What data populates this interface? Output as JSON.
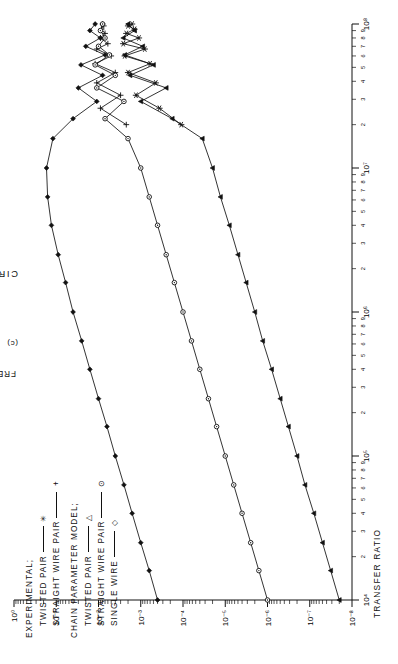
{
  "figure": {
    "caption_title": "CIRCUIT SEPARATION: 2 CM.",
    "subcaption": "(c)"
  },
  "legend": {
    "group1_heading": "EXPERIMENTAL;",
    "group2_heading": "CHAIN PARAMETER MODEL;",
    "entries": [
      {
        "label": "TWISTED PAIR",
        "marker": "asterisk-marker",
        "glyph": "✳",
        "group": 1
      },
      {
        "label": "STRAIGHT WIRE PAIR",
        "marker": "plus-marker",
        "glyph": "+",
        "group": 1
      },
      {
        "label": "TWISTED PAIR",
        "marker": "triangle-marker",
        "glyph": "△",
        "group": 2
      },
      {
        "label": "STRAIGHT WIRE PAIR",
        "marker": "circle-marker",
        "glyph": "⊙",
        "group": 2
      },
      {
        "label": "SINGLE WIRE",
        "marker": "diamond-marker",
        "glyph": "◇",
        "group": 2
      }
    ]
  },
  "chart_data": {
    "type": "line",
    "title": "CIRCUIT SEPARATION: 2 CM.",
    "xlabel": "FREQUENCY (HZ.)",
    "ylabel": "TRANSFER RATIO",
    "xscale": "log",
    "yscale": "log",
    "xlim": [
      10000,
      100000000
    ],
    "ylim": [
      1e-08,
      1
    ],
    "grid": false,
    "legend_position": "upper-left",
    "x_tick_labels": [
      "10⁴",
      "10⁵",
      "10⁶",
      "10⁷",
      "10⁸"
    ],
    "x_tick_values": [
      10000,
      100000,
      1000000,
      10000000,
      100000000
    ],
    "x_minor_labels": [
      "2",
      "3",
      "4",
      "5",
      "6",
      "7",
      "8",
      "9"
    ],
    "y_tick_labels": [
      "10⁰",
      "10⁻¹",
      "10⁻²",
      "10⁻³",
      "10⁻⁴",
      "10⁻⁵",
      "10⁻⁶",
      "10⁻⁷",
      "10⁻⁸"
    ],
    "y_tick_values": [
      1,
      0.1,
      0.01,
      0.001,
      0.0001,
      1e-05,
      1e-06,
      1e-07,
      1e-08
    ],
    "series": [
      {
        "name": "EXPERIMENTAL TWISTED PAIR",
        "marker": "asterisk-marker",
        "x": [
          20000000.0,
          26000000.0,
          32000000.0,
          39000000.0,
          46000000.0,
          53000000.0,
          60000000.0,
          67000000.0,
          73000000.0,
          80000000.0,
          86000000.0,
          92000000.0,
          97000000.0,
          100000000.0
        ],
        "y": [
          0.00011,
          0.00036,
          0.0013,
          0.00044,
          0.002,
          0.0006,
          0.0024,
          0.0008,
          0.0026,
          0.0011,
          0.0022,
          0.0014,
          0.002,
          0.0016
        ]
      },
      {
        "name": "EXPERIMENTAL STRAIGHT WIRE PAIR",
        "marker": "plus-marker",
        "x": [
          20000000.0,
          26000000.0,
          32000000.0,
          39000000.0,
          46000000.0,
          53000000.0,
          60000000.0,
          67000000.0,
          73000000.0,
          80000000.0,
          86000000.0,
          92000000.0,
          97000000.0,
          100000000.0
        ],
        "y": [
          0.0022,
          0.009,
          0.003,
          0.011,
          0.004,
          0.012,
          0.005,
          0.011,
          0.006,
          0.009,
          0.007,
          0.0085,
          0.0075,
          0.008
        ]
      },
      {
        "name": "MODEL TWISTED PAIR",
        "marker": "triangle-marker",
        "x": [
          10000.0,
          16000.0,
          25000.0,
          40000.0,
          63000.0,
          100000.0,
          160000.0,
          250000.0,
          400000.0,
          630000.0,
          1000000.0,
          1600000.0,
          2500000.0,
          4000000.0,
          6300000.0,
          10000000.0,
          16000000.0,
          22000000.0,
          29000000.0,
          36000000.0,
          44000000.0,
          52000000.0,
          61000000.0,
          70000000.0,
          80000000.0,
          90000000.0,
          100000000.0
        ],
        "y": [
          2e-08,
          3.2e-08,
          5e-08,
          8e-08,
          1.3e-07,
          2e-07,
          3.2e-07,
          5e-07,
          8e-07,
          1.3e-06,
          2e-06,
          3.2e-06,
          5e-06,
          8e-06,
          1.3e-05,
          2e-05,
          3.5e-05,
          0.00018,
          0.001,
          0.00025,
          0.0018,
          0.0005,
          0.0024,
          0.0009,
          0.0026,
          0.0014,
          0.002
        ]
      },
      {
        "name": "MODEL STRAIGHT WIRE PAIR",
        "marker": "circle-marker",
        "x": [
          10000.0,
          16000.0,
          25000.0,
          40000.0,
          63000.0,
          100000.0,
          160000.0,
          250000.0,
          400000.0,
          630000.0,
          1000000.0,
          1600000.0,
          2500000.0,
          4000000.0,
          6300000.0,
          10000000.0,
          16000000.0,
          22000000.0,
          29000000.0,
          36000000.0,
          44000000.0,
          52000000.0,
          61000000.0,
          70000000.0,
          80000000.0,
          90000000.0,
          100000000.0
        ],
        "y": [
          1e-06,
          1.6e-06,
          2.5e-06,
          4e-06,
          6.3e-06,
          1e-05,
          1.6e-05,
          2.5e-05,
          4e-05,
          6.3e-05,
          0.0001,
          0.00016,
          0.00025,
          0.0004,
          0.00063,
          0.001,
          0.002,
          0.007,
          0.0025,
          0.011,
          0.004,
          0.012,
          0.0055,
          0.01,
          0.007,
          0.009,
          0.008
        ]
      },
      {
        "name": "MODEL SINGLE WIRE",
        "marker": "diamond-marker",
        "x": [
          10000.0,
          16000.0,
          25000.0,
          40000.0,
          63000.0,
          100000.0,
          160000.0,
          250000.0,
          400000.0,
          630000.0,
          1000000.0,
          1600000.0,
          2500000.0,
          4000000.0,
          6300000.0,
          10000000.0,
          16000000.0,
          22000000.0,
          29000000.0,
          36000000.0,
          44000000.0,
          52000000.0,
          61000000.0,
          70000000.0,
          80000000.0,
          90000000.0,
          100000000.0
        ],
        "y": [
          0.0004,
          0.00063,
          0.001,
          0.0016,
          0.0025,
          0.004,
          0.0063,
          0.01,
          0.016,
          0.025,
          0.04,
          0.06,
          0.09,
          0.13,
          0.16,
          0.17,
          0.12,
          0.04,
          0.011,
          0.03,
          0.008,
          0.026,
          0.007,
          0.02,
          0.009,
          0.016,
          0.012
        ]
      }
    ]
  },
  "axes": {
    "x_title": "FREQUENCY (HZ.)",
    "y_title": "TRANSFER RATIO"
  }
}
